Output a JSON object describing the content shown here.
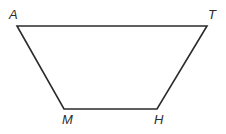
{
  "figure": {
    "name": "trapezoid-AMHT",
    "shape_type": "trapezoid",
    "background_color": "#ffffff",
    "stroke_color": "#2b2b2b",
    "stroke_width": 1.6,
    "canvas": {
      "width": 226,
      "height": 134
    },
    "vertices": [
      {
        "id": "A",
        "label": "A",
        "x": 17,
        "y": 26,
        "label_x": 9,
        "label_y": 8
      },
      {
        "id": "T",
        "label": "T",
        "x": 207,
        "y": 26,
        "label_x": 208,
        "label_y": 8
      },
      {
        "id": "H",
        "label": "H",
        "x": 157,
        "y": 109,
        "label_x": 154,
        "label_y": 113
      },
      {
        "id": "M",
        "label": "M",
        "x": 64,
        "y": 109,
        "label_x": 62,
        "label_y": 113
      }
    ],
    "edges": [
      {
        "id": "AT",
        "from": "A",
        "to": "T",
        "name": "top-side-AT"
      },
      {
        "id": "TH",
        "from": "T",
        "to": "H",
        "name": "right-side-TH"
      },
      {
        "id": "HM",
        "from": "H",
        "to": "M",
        "name": "bottom-side-HM"
      },
      {
        "id": "MA",
        "from": "M",
        "to": "A",
        "name": "left-side-MA"
      }
    ],
    "polygon_points": "17,26 207,26 157,109 64,109"
  }
}
